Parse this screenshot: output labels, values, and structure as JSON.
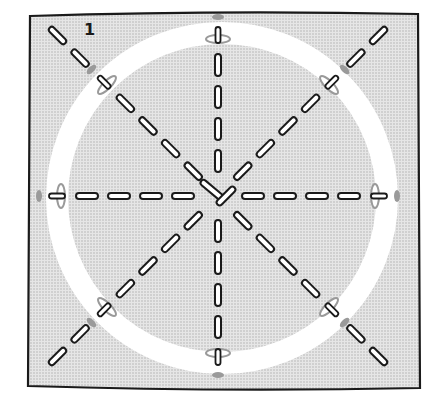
{
  "figure": {
    "step_label": "1",
    "colors": {
      "background": "#ffffff",
      "panel_fill": "#e4e4e4",
      "panel_dots": "#bdbdbd",
      "outline": "#1a1a1a",
      "ring": "#ffffff",
      "marker": "#9a9a9a"
    },
    "panel": {
      "x": 22,
      "y": 12,
      "width": 400,
      "height": 380
    },
    "ring": {
      "cx": 222,
      "cy": 198,
      "r": 165,
      "stroke_width": 22
    },
    "center": {
      "x": 218,
      "y": 196
    },
    "rays": [
      {
        "name": "north",
        "angle": -90
      },
      {
        "name": "north-east",
        "angle": -45
      },
      {
        "name": "east",
        "angle": 0
      },
      {
        "name": "south-east",
        "angle": 45
      },
      {
        "name": "south",
        "angle": 90
      },
      {
        "name": "south-west",
        "angle": 135
      },
      {
        "name": "west",
        "angle": 180
      },
      {
        "name": "north-west",
        "angle": -135
      }
    ]
  }
}
